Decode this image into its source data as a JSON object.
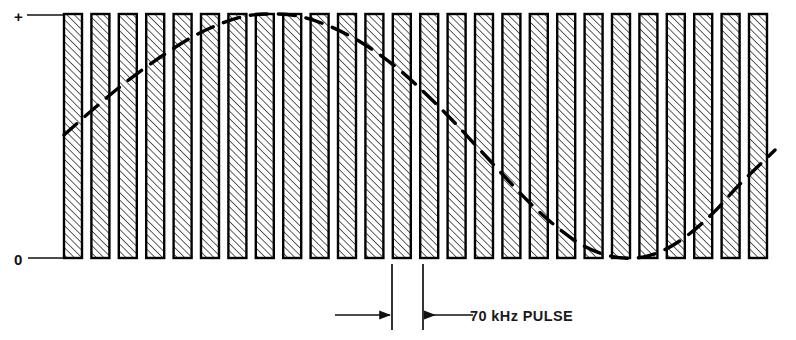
{
  "figure": {
    "axis": {
      "plus_label": "+",
      "zero_label": "0"
    },
    "annotation": {
      "pulse_label": "70 kHz  PULSE"
    },
    "colors": {
      "ink": "#000000",
      "background": "#ffffff",
      "hatch": "#2b2b2b"
    }
  },
  "chart_data": {
    "type": "bar",
    "xlabel": "",
    "ylabel": "",
    "ylim": [
      0,
      1
    ],
    "grid": false,
    "legend": null,
    "axis_tick_labels": [
      "+",
      "0"
    ],
    "annotations": [
      {
        "text": "70 kHz  PULSE",
        "x_px": 470,
        "y_px": 317,
        "kind": "dimension-callout",
        "dimension_from_px": 392,
        "dimension_to_px": 423
      }
    ],
    "bars": {
      "count": 26,
      "first_left_px": 64,
      "bar_width_px": 18,
      "period_px": 27.4,
      "baseline_y_px": 258,
      "top_y_px": 14,
      "fill": "diagonal-hatch",
      "note": "all pulses full amplitude, constant width, constant period"
    },
    "categories": [
      "p1",
      "p2",
      "p3",
      "p4",
      "p5",
      "p6",
      "p7",
      "p8",
      "p9",
      "p10",
      "p11",
      "p12",
      "p13",
      "p14",
      "p15",
      "p16",
      "p17",
      "p18",
      "p19",
      "p20",
      "p21",
      "p22",
      "p23",
      "p24",
      "p25",
      "p26"
    ],
    "values": [
      1,
      1,
      1,
      1,
      1,
      1,
      1,
      1,
      1,
      1,
      1,
      1,
      1,
      1,
      1,
      1,
      1,
      1,
      1,
      1,
      1,
      1,
      1,
      1,
      1,
      1
    ],
    "series": [
      {
        "name": "70 kHz pulse train",
        "type": "bar",
        "values": [
          1,
          1,
          1,
          1,
          1,
          1,
          1,
          1,
          1,
          1,
          1,
          1,
          1,
          1,
          1,
          1,
          1,
          1,
          1,
          1,
          1,
          1,
          1,
          1,
          1,
          1
        ]
      },
      {
        "name": "modulation envelope (dashed sine)",
        "type": "line",
        "style": "dashed",
        "x_px": [
          64,
          90,
          116,
          142,
          168,
          194,
          220,
          246,
          272,
          298,
          324,
          350,
          376,
          402,
          428,
          454,
          480,
          506,
          532,
          558,
          584,
          610,
          636,
          662,
          688,
          714,
          740,
          775
        ],
        "y_px": [
          135,
          112,
          90,
          70,
          52,
          36,
          24,
          16,
          14,
          16,
          24,
          36,
          52,
          72,
          96,
          122,
          150,
          178,
          205,
          228,
          246,
          256,
          258,
          251,
          235,
          212,
          184,
          150
        ],
        "y_norm": [
          0.5,
          0.6,
          0.69,
          0.77,
          0.84,
          0.91,
          0.96,
          0.99,
          1.0,
          0.99,
          0.96,
          0.91,
          0.84,
          0.76,
          0.66,
          0.56,
          0.44,
          0.33,
          0.22,
          0.12,
          0.05,
          0.01,
          0.0,
          0.03,
          0.09,
          0.19,
          0.3,
          0.44
        ],
        "peak_x_px": 272,
        "trough_x_px": 636
      }
    ]
  }
}
